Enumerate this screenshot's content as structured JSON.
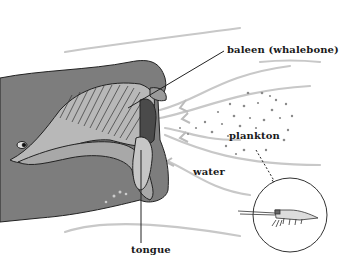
{
  "diagram": {
    "labels": {
      "baleen": "baleen (whalebone)",
      "plankton": "plankton",
      "water": "water",
      "tongue": "tongue"
    },
    "colors": {
      "whale_body": "#7d7d7d",
      "whale_dark": "#5a5a5a",
      "mouth_light": "#b8b8b8",
      "water_lines": "#c4c4c4",
      "plankton_dots": "#8a8a8a",
      "outline": "#222222"
    }
  }
}
